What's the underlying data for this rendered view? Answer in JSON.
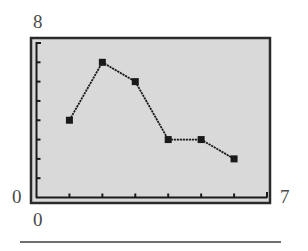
{
  "chart_data": {
    "type": "line",
    "title": "",
    "xlabel": "",
    "ylabel": "",
    "x": [
      1,
      2,
      3,
      4,
      5,
      6
    ],
    "series": [
      {
        "name": "data",
        "values": [
          4,
          7,
          6,
          3,
          3,
          2
        ],
        "marker": "square"
      }
    ],
    "xlim": [
      0,
      7
    ],
    "ylim": [
      0,
      8
    ],
    "x_ticks": [
      1,
      2,
      3,
      4,
      5,
      6,
      7
    ],
    "y_ticks": [
      1,
      2,
      3,
      4,
      5,
      6,
      7,
      8
    ],
    "grid": false,
    "legend": "none"
  },
  "labels": {
    "y_max": "8",
    "y_min": "0",
    "x_min": "0",
    "x_max": "7"
  },
  "colors": {
    "plot_background": "#d9d9d9",
    "line": "#1a1a1a",
    "frame": "#2a2a2a",
    "label_text": "#4a4a4a"
  }
}
